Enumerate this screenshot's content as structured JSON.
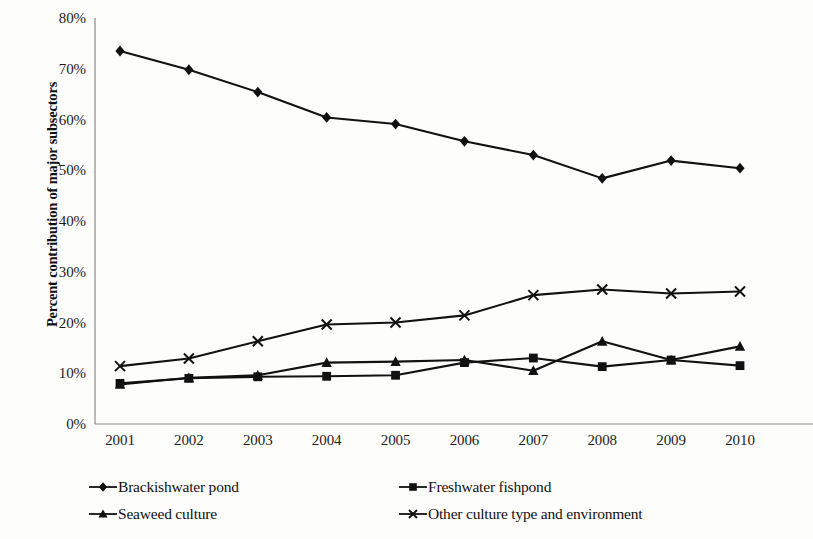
{
  "chart_data": {
    "type": "line",
    "title": "",
    "xlabel": "",
    "ylabel": "Percent contribution of major subsectors",
    "categories": [
      "2001",
      "2002",
      "2003",
      "2004",
      "2005",
      "2006",
      "2007",
      "2008",
      "2009",
      "2010"
    ],
    "ylim": [
      0,
      80
    ],
    "ytick_values": [
      0,
      10,
      20,
      30,
      40,
      50,
      60,
      70,
      80
    ],
    "ytick_labels": [
      "0%",
      "10%",
      "20%",
      "30%",
      "40%",
      "50%",
      "60%",
      "70%",
      "80%"
    ],
    "grid": false,
    "legend_position": "bottom",
    "series": [
      {
        "name": "Brackishwater pond",
        "marker": "diamond",
        "color": "#111111",
        "values": [
          73.5,
          69.8,
          65.4,
          60.4,
          59.1,
          55.7,
          53.0,
          48.4,
          51.9,
          50.4
        ]
      },
      {
        "name": "Freshwater fishpond",
        "marker": "square",
        "color": "#111111",
        "values": [
          8.0,
          9.0,
          9.3,
          9.4,
          9.6,
          12.1,
          13.0,
          11.3,
          12.6,
          11.5
        ]
      },
      {
        "name": "Seaweed culture",
        "marker": "triangle",
        "color": "#111111",
        "values": [
          7.8,
          9.1,
          9.6,
          12.1,
          12.3,
          12.6,
          10.5,
          16.3,
          12.6,
          15.3
        ]
      },
      {
        "name": "Other culture type and environment",
        "marker": "cross",
        "color": "#111111",
        "values": [
          11.4,
          12.9,
          16.3,
          19.6,
          20.0,
          21.4,
          25.4,
          26.5,
          25.7,
          26.1
        ]
      }
    ]
  },
  "axis": {
    "y_title": "Percent contribution of major subsectors"
  },
  "legend": {
    "items": [
      {
        "label": "Brackishwater pond",
        "marker": "diamond-marker-icon"
      },
      {
        "label": "Freshwater fishpond",
        "marker": "square-marker-icon"
      },
      {
        "label": "Seaweed culture",
        "marker": "triangle-marker-icon"
      },
      {
        "label": "Other culture type and environment",
        "marker": "cross-marker-icon"
      }
    ]
  }
}
